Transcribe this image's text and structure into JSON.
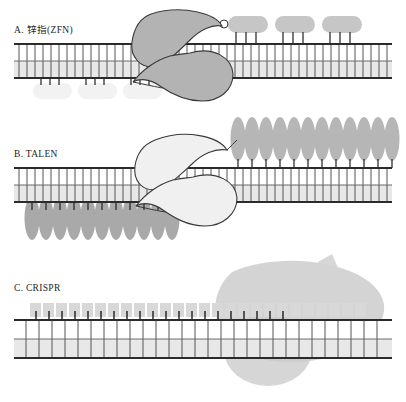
{
  "figure": {
    "background_color": "#ffffff",
    "width": 406,
    "height": 402
  },
  "palette": {
    "outline": "#2b2b2b",
    "dna_rail": "#2b2b2b",
    "dna_rung": "#555555",
    "dna_fill_upper": "#ffffff",
    "dna_fill_lower": "#e8e8e8",
    "nuclease_fill": "#b3b3b3",
    "nuclease_stroke": "#3a3a3a",
    "zf_module_dark": "#c6c6c6",
    "zf_module_light": "#f2f2f2",
    "tale_repeat": "#a9a9a9",
    "tale_repeat_light": "#c9c9c9",
    "cas9_blob": "#cccccc",
    "grna_block": "#d8d8d8",
    "grna_tail": "#d4d4d4",
    "contact_stem": "#1f1f1f",
    "text": "#1d1d1d"
  },
  "panels": [
    {
      "id": "A",
      "label": "A. 锌指(ZFN)",
      "label_prefix": "A.",
      "label_name": "锌指(ZFN)",
      "technology": "Zinc Finger Nuclease",
      "dna": {
        "x": 14,
        "y": 44,
        "width": 378,
        "height": 34,
        "rung_count": 46
      },
      "binding_modules": {
        "shape": "rounded-rectangle",
        "top_count": 3,
        "bottom_count": 3,
        "contacts_per_module": 3,
        "top_color": "#c6c6c6",
        "bottom_color": "#f2f2f2"
      },
      "nuclease_domains": {
        "count": 2,
        "shape": "comma-lobe",
        "name": "FokI"
      }
    },
    {
      "id": "B",
      "label": "B. TALEN",
      "label_prefix": "B.",
      "label_name": "TALEN",
      "technology": "Transcription Activator-Like Effector Nuclease",
      "dna": {
        "x": 14,
        "y": 168,
        "width": 378,
        "height": 34,
        "rung_count": 46
      },
      "binding_modules": {
        "shape": "tall-ellipse",
        "top_count": 12,
        "bottom_count": 11,
        "contacts_per_module": 1,
        "top_color": "#b6b6b6",
        "bottom_color": "#a9a9a9"
      },
      "nuclease_domains": {
        "count": 2,
        "shape": "comma-lobe",
        "name": "FokI"
      }
    },
    {
      "id": "C",
      "label": "C. CRISPR",
      "label_prefix": "C.",
      "label_name": "CRISPR",
      "technology": "CRISPR-Cas9",
      "dna": {
        "x": 14,
        "y": 318,
        "width": 378,
        "height": 38,
        "rung_count": 30
      },
      "binding_modules": {
        "shape": "square-block",
        "top_count": 26,
        "bottom_count": 0,
        "contacts_per_module": 1,
        "top_color": "#d8d8d8",
        "bottom_color": "#d8d8d8"
      },
      "nuclease_domains": {
        "count": 1,
        "shape": "large-blob",
        "name": "Cas9"
      },
      "guide_rna": {
        "present": true,
        "shape": "diagonal-tail"
      }
    }
  ]
}
